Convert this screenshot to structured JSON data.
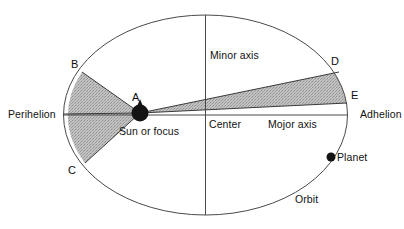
{
  "figure": {
    "type": "diagram",
    "background_color": "#ffffff",
    "line_color": "#3c3c3c",
    "shade_color": "#b9b9b9",
    "sun_color": "#1a1a1a"
  },
  "labels": {
    "perihelion": "Perihelion",
    "adhelion": "Adhelion",
    "minor_axis": "Minor axis",
    "major_axis": "Mojor axis",
    "center": "Center",
    "sun_or_focus": "Sun or focus",
    "planet": "Planet",
    "orbit": "Orbit"
  },
  "points": {
    "a": "A",
    "b": "B",
    "c": "C",
    "d": "D",
    "e": "E"
  },
  "geometry": {
    "ellipse": {
      "cx": 205.5,
      "cy": 115,
      "rx": 142,
      "ry": 100
    },
    "focus": {
      "x": 140,
      "y": 113
    },
    "center_point": {
      "x": 205.5,
      "y": 115
    },
    "point_b": {
      "x": 82,
      "y": 72
    },
    "point_c": {
      "x": 85,
      "y": 163
    },
    "point_d": {
      "x": 339,
      "y": 72
    },
    "point_e": {
      "x": 347,
      "y": 103
    },
    "planet_dot": {
      "x": 331,
      "y": 157
    },
    "major_axis_y": 115,
    "minor_axis_x": 205.5
  }
}
